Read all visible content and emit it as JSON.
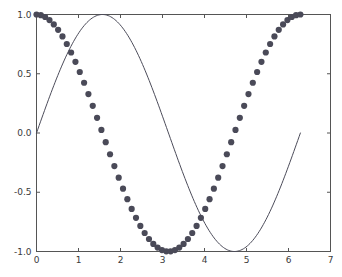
{
  "figure": {
    "background_color": "#ffffff",
    "axes_color": "#555555",
    "tick_label_color": "#3a3a3a"
  },
  "chart_data": {
    "type": "line",
    "title": "",
    "xlabel": "",
    "ylabel": "",
    "xlim": [
      0,
      7
    ],
    "ylim": [
      -1.0,
      1.0
    ],
    "grid": false,
    "legend": null,
    "xticks": [
      0,
      1,
      2,
      3,
      4,
      5,
      6,
      7
    ],
    "xtick_labels": [
      "0",
      "1",
      "2",
      "3",
      "4",
      "5",
      "6",
      "7"
    ],
    "yticks": [
      -1.0,
      -0.5,
      0.0,
      0.5,
      1.0
    ],
    "ytick_labels": [
      "-1.0",
      "-0.5",
      "0.0",
      "0.5",
      "1.0"
    ],
    "series": [
      {
        "name": "sin(x)",
        "style": "line",
        "color": "#4c4c5a",
        "linewidth": 1,
        "x_start": 0.0,
        "x_end": 6.283185307179586,
        "n_points": 200,
        "function": "sin",
        "amplitude": 1.0,
        "phase": 0.0
      },
      {
        "name": "cos(x)",
        "style": "markers",
        "marker": "circle",
        "color": "#4a4a58",
        "marker_size": 3.1,
        "x_start": 0.0,
        "x_end": 6.283185307179586,
        "n_points": 62,
        "function": "cos",
        "amplitude": 1.0,
        "phase": 0.0
      }
    ]
  }
}
